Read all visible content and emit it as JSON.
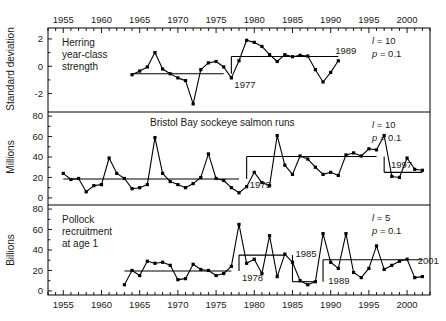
{
  "figure": {
    "width": 446,
    "height": 321,
    "background": "#ffffff",
    "ink": "#000000"
  },
  "axis": {
    "x_label": "",
    "x_ticks": [
      1955,
      1960,
      1965,
      1970,
      1975,
      1980,
      1985,
      1990,
      1995,
      2000
    ],
    "x_min": 1953,
    "x_max": 2003,
    "minor_tick_step": 1,
    "top_axis_labels": [
      1955,
      1960,
      1965,
      1970,
      1975,
      1980,
      1985,
      1990,
      1995,
      2000
    ],
    "bottom_axis_labels": [
      1955,
      1960,
      1965,
      1970,
      1975,
      1980,
      1985,
      1990,
      1995,
      2000
    ]
  },
  "chart_data": [
    {
      "type": "line",
      "panel": 1,
      "title": "Herring year-class strength",
      "label_lines": [
        "Herring",
        "year-class",
        "strength"
      ],
      "ylabel": "Standard deviation",
      "ylim": [
        -3.2,
        2.8
      ],
      "yticks": [
        -2,
        0,
        2
      ],
      "grid": false,
      "legend": "none",
      "annotations": [
        {
          "text": "1977",
          "year": 1977,
          "value": -1.35
        },
        {
          "text": "1989",
          "year": 1990.2,
          "value": 1.15
        }
      ],
      "stats": {
        "l_label": "l",
        "l_value": "10",
        "p_label": "p",
        "p_value": "0.1"
      },
      "step_segments": [
        {
          "start_year": 1964,
          "end_year": 1976,
          "level": -0.55
        },
        {
          "start_year": 1977,
          "end_year": 1991,
          "level": 0.72
        }
      ],
      "x": [
        1964,
        1965,
        1966,
        1967,
        1968,
        1969,
        1970,
        1971,
        1972,
        1973,
        1974,
        1975,
        1976,
        1977,
        1978,
        1979,
        1980,
        1981,
        1982,
        1983,
        1984,
        1985,
        1986,
        1987,
        1988,
        1989,
        1990,
        1991
      ],
      "values": [
        -0.62,
        -0.35,
        -0.05,
        1.0,
        -0.2,
        -0.55,
        -0.85,
        -1.05,
        -2.75,
        -0.25,
        0.25,
        0.35,
        -0.05,
        -0.85,
        0.4,
        1.9,
        1.75,
        1.45,
        0.85,
        0.35,
        0.85,
        0.7,
        0.8,
        0.75,
        -0.25,
        -1.15,
        -0.45,
        0.4
      ]
    },
    {
      "type": "line",
      "panel": 2,
      "title": "Bristol Bay sockeye salmon runs",
      "label_lines": [
        "Bristol Bay sockeye salmon runs"
      ],
      "ylabel": "Millions",
      "ylim": [
        -4,
        84
      ],
      "yticks": [
        0,
        20,
        40,
        60,
        80
      ],
      "grid": false,
      "legend": "none",
      "annotations": [
        {
          "text": "1979",
          "year": 1979,
          "value": 13
        },
        {
          "text": "1997",
          "year": 1997.5,
          "value": 33
        }
      ],
      "stats": {
        "l_label": "l",
        "l_value": "10",
        "p_label": "p",
        "p_value": "0.1"
      },
      "step_segments": [
        {
          "start_year": 1955,
          "end_year": 1978,
          "level": 18.5
        },
        {
          "start_year": 1979,
          "end_year": 1996,
          "level": 40.5
        },
        {
          "start_year": 1997,
          "end_year": 2002,
          "level": 25.0
        }
      ],
      "x": [
        1955,
        1956,
        1957,
        1958,
        1959,
        1960,
        1961,
        1962,
        1963,
        1964,
        1965,
        1966,
        1967,
        1968,
        1969,
        1970,
        1971,
        1972,
        1973,
        1974,
        1975,
        1976,
        1977,
        1978,
        1979,
        1980,
        1981,
        1982,
        1983,
        1984,
        1985,
        1986,
        1987,
        1988,
        1989,
        1990,
        1991,
        1992,
        1993,
        1994,
        1995,
        1996,
        1997,
        1998,
        1999,
        2000,
        2001,
        2002
      ],
      "values": [
        24,
        18,
        19,
        6,
        12,
        13,
        39,
        24,
        19,
        9,
        10,
        13,
        59,
        24,
        16,
        13,
        10,
        14,
        20,
        43,
        19,
        17,
        10,
        5,
        11,
        25,
        15,
        12,
        61,
        32,
        23,
        41,
        38,
        30,
        23,
        25,
        22,
        42,
        44,
        41,
        48,
        47,
        61,
        21,
        20,
        39,
        28,
        27
      ]
    },
    {
      "type": "line",
      "panel": 3,
      "title": "Pollock recruitment at age 1",
      "label_lines": [
        "Pollock",
        "recruitment",
        "at age 1"
      ],
      "ylabel": "Billions",
      "ylim": [
        -4,
        84
      ],
      "yticks": [
        0,
        20,
        40,
        60,
        80
      ],
      "grid": false,
      "legend": "none",
      "annotations": [
        {
          "text": "1978",
          "year": 1978,
          "value": 13
        },
        {
          "text": "1985",
          "year": 1985,
          "value": 37
        },
        {
          "text": "1989",
          "year": 1989.3,
          "value": 10
        },
        {
          "text": "2001",
          "year": 2001,
          "value": 30
        }
      ],
      "stats": {
        "l_label": "l",
        "l_value": "5",
        "p_label": "p",
        "p_value": "0.1"
      },
      "step_segments": [
        {
          "start_year": 1963,
          "end_year": 1977,
          "level": 19.5
        },
        {
          "start_year": 1978,
          "end_year": 1984,
          "level": 35.0
        },
        {
          "start_year": 1985,
          "end_year": 1988,
          "level": 9.0
        },
        {
          "start_year": 1989,
          "end_year": 2002,
          "level": 30.5
        }
      ],
      "x": [
        1963,
        1964,
        1965,
        1966,
        1967,
        1968,
        1969,
        1970,
        1971,
        1972,
        1973,
        1974,
        1975,
        1976,
        1977,
        1978,
        1979,
        1980,
        1981,
        1982,
        1983,
        1984,
        1985,
        1986,
        1987,
        1988,
        1989,
        1990,
        1991,
        1992,
        1993,
        1994,
        1995,
        1996,
        1997,
        1998,
        1999,
        2000,
        2001,
        2002
      ],
      "values": [
        6,
        20,
        15,
        29,
        27,
        28,
        25,
        11,
        12,
        26,
        21,
        20,
        15,
        17,
        24,
        65,
        27,
        31,
        17,
        54,
        14,
        36,
        28,
        10,
        6,
        9,
        56,
        28,
        22,
        56,
        18,
        13,
        22,
        44,
        21,
        25,
        29,
        31,
        13,
        14
      ]
    }
  ]
}
